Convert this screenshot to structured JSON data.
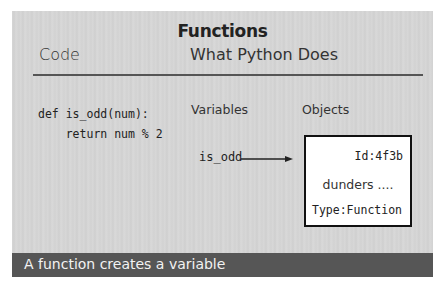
{
  "slide": {
    "title": "Functions",
    "columns": {
      "code_header": "Code",
      "python_header": "What Python Does"
    },
    "code_lines": "def is_odd(num):\n    return num % 2",
    "diagram": {
      "variables_label": "Variables",
      "objects_label": "Objects",
      "variable_name": "is_odd",
      "arrow_icon": "right-arrow",
      "object": {
        "id": "Id:4f3b",
        "dunders": "dunders ....",
        "type": "Type:Function"
      }
    },
    "caption": "A function creates a variable",
    "colors": {
      "background": "#d5d5d5",
      "banner": "#565656",
      "banner_text": "#f2f2f2",
      "box_border": "#111111"
    }
  }
}
